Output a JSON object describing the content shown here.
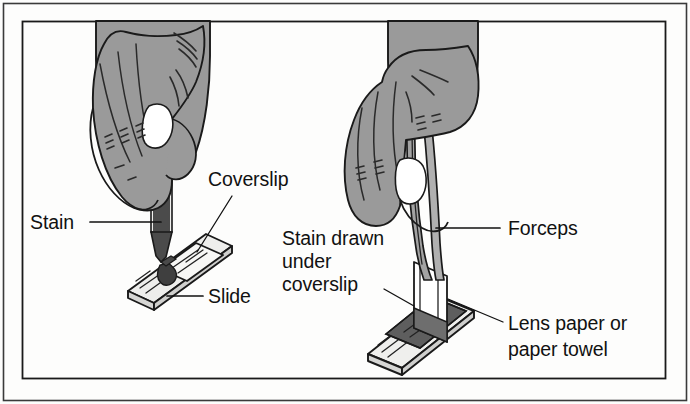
{
  "figure": {
    "border": {
      "outer_color": "#333333",
      "inner_color": "#1a1a1a"
    },
    "colors": {
      "skin": "#9a9a9a",
      "skin_shadow": "#8a8a8a",
      "outline": "#1a1a1a",
      "glass": "#f2f2f0",
      "glass_shade": "#dedede",
      "stain_dark": "#3c3c3c",
      "stain_mid": "#6e6e6e",
      "bulb": "#2f2f2f",
      "paper": "#ffffff",
      "background": "#fdfdfc",
      "text": "#111111"
    }
  },
  "labels": {
    "coverslip": {
      "text": "Coverslip",
      "panel": "left",
      "points_to": "coverslip-on-slide"
    },
    "stain": {
      "text": "Stain",
      "panel": "left",
      "points_to": "dropper-stain-column"
    },
    "slide": {
      "text": "Slide",
      "panel": "left",
      "points_to": "microscope-slide"
    },
    "stain_drawn": {
      "lines": [
        "Stain drawn",
        "under",
        "coverslip"
      ],
      "panel": "right",
      "points_to": "stain-under-coverslip"
    },
    "forceps": {
      "text": "Forceps",
      "panel": "right",
      "points_to": "forceps-tongs"
    },
    "lens_paper": {
      "lines": [
        "Lens paper or",
        "paper towel"
      ],
      "panel": "right",
      "points_to": "lens-paper-strip"
    }
  },
  "panels": {
    "left": {
      "name": "applying-stain",
      "objects": [
        "hand",
        "dropper",
        "stain",
        "coverslip",
        "slide"
      ]
    },
    "right": {
      "name": "drawing-stain-under-coverslip",
      "objects": [
        "hand",
        "forceps",
        "lens-paper",
        "stain",
        "coverslip",
        "slide"
      ]
    }
  }
}
